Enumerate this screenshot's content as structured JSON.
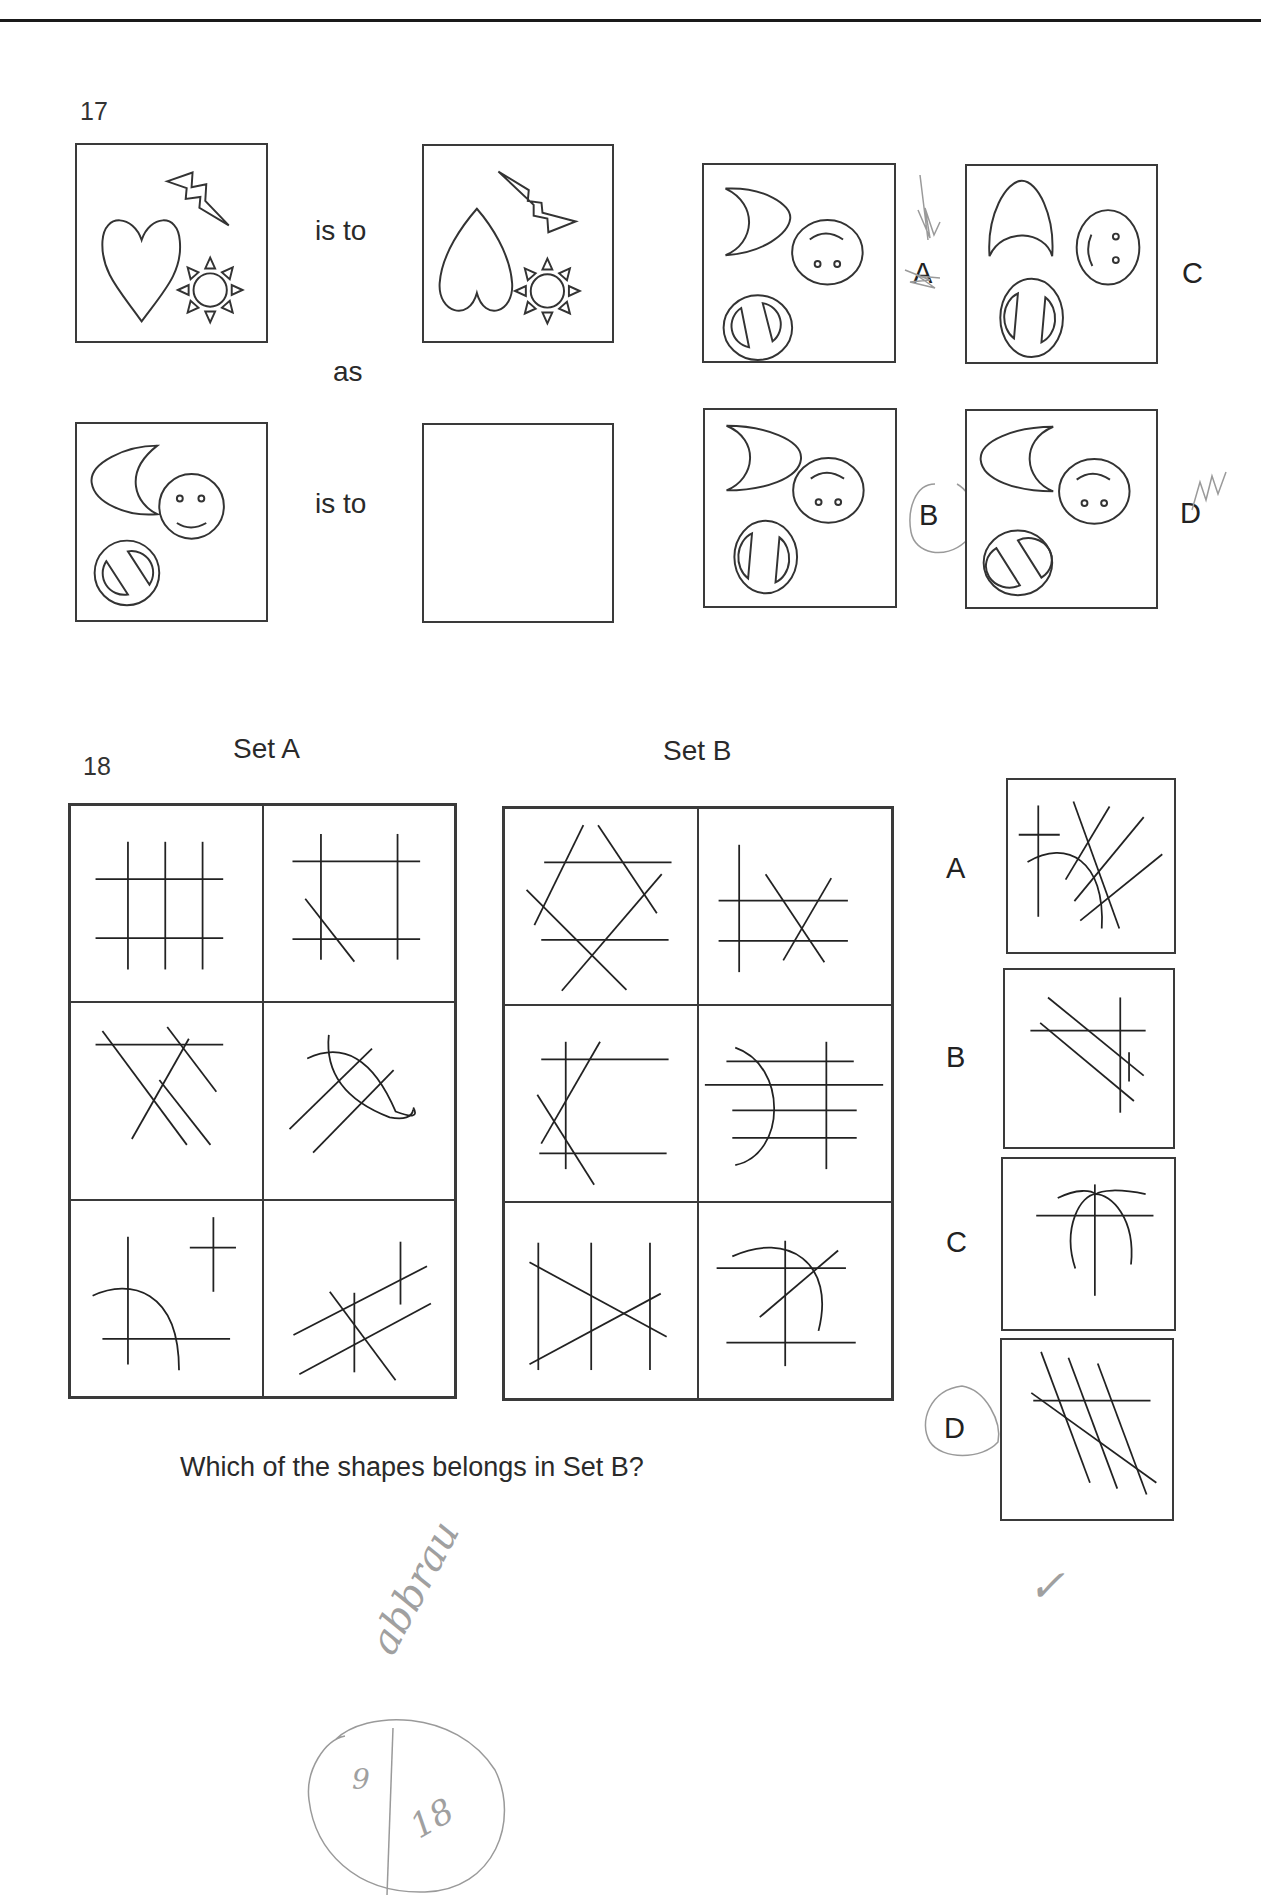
{
  "header": {
    "rule": "top-divider"
  },
  "question17": {
    "number": "17",
    "relation_word_1": "is to",
    "connector": "as",
    "relation_word_2": "is to",
    "stimulus_1": {
      "shapes": [
        "heart",
        "lightning-bolt",
        "sun"
      ]
    },
    "response_1": {
      "shapes": [
        "heart-inverted",
        "lightning-bolt-rotated",
        "sun"
      ]
    },
    "stimulus_2": {
      "shapes": [
        "crescent-moon",
        "smiley-face",
        "no-entry-sign"
      ]
    },
    "response_2": {
      "shapes": []
    },
    "options": [
      {
        "label": "A",
        "shapes": [
          "crescent-moon-right",
          "face-upside-down",
          "no-entry-rotated"
        ]
      },
      {
        "label": "B",
        "shapes": [
          "crescent-moon-right",
          "face-upside-down",
          "no-entry-rotated"
        ]
      },
      {
        "label": "C",
        "shapes": [
          "crescent-moon-up",
          "face-sideways",
          "no-entry-rotated"
        ]
      },
      {
        "label": "D",
        "shapes": [
          "crescent-moon-left",
          "face-upside-down",
          "no-entry-sign"
        ]
      }
    ],
    "marked_answer": "B"
  },
  "question18": {
    "number": "18",
    "set_a_title": "Set A",
    "set_b_title": "Set B",
    "prompt": "Which of the shapes belongs in Set B?",
    "options": [
      {
        "label": "A"
      },
      {
        "label": "B"
      },
      {
        "label": "C"
      },
      {
        "label": "D"
      }
    ],
    "marked_answer": "D"
  },
  "annotations": {
    "handwritten_word": "abbrau",
    "score_numerator": "9",
    "score_denominator": "18",
    "checkmark": "✓",
    "ink_color": "#9a9a9a"
  }
}
